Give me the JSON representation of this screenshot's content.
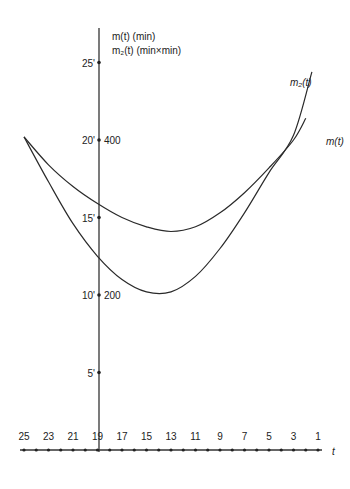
{
  "chart_data": {
    "type": "line",
    "title": "",
    "ylabel_lines": [
      "m(t) (min)",
      "m₂(t) (min×min)"
    ],
    "xlabel": "t",
    "x_ticks": [
      25,
      23,
      21,
      19,
      17,
      15,
      13,
      11,
      9,
      7,
      5,
      3,
      1
    ],
    "x_reversed": true,
    "y_ticks_left": [
      "5'",
      "10'",
      "15'",
      "20'",
      "25'"
    ],
    "y_ticks_left_values": [
      5,
      10,
      15,
      20,
      25
    ],
    "y_ticks_right": [
      "200",
      "400"
    ],
    "y_ticks_right_at": [
      10,
      20
    ],
    "ylim": [
      0,
      27
    ],
    "xlim": [
      25.5,
      0.5
    ],
    "series": [
      {
        "name": "m(t)",
        "unit": "min",
        "x": [
          25,
          23,
          21,
          19,
          17,
          15,
          13,
          11,
          9,
          7,
          5,
          3,
          2
        ],
        "values": [
          20.2,
          18.4,
          17.0,
          15.9,
          15.0,
          14.4,
          14.1,
          14.4,
          15.3,
          16.6,
          18.2,
          20.0,
          21.4
        ]
      },
      {
        "name": "m₂(t)",
        "unit": "min×min",
        "x": [
          25,
          23,
          21,
          19,
          17,
          15,
          13,
          11,
          9,
          7,
          5,
          3,
          1.5
        ],
        "values": [
          20.2,
          17.3,
          14.6,
          12.5,
          11.0,
          10.2,
          10.2,
          11.2,
          13.0,
          15.3,
          17.9,
          20.3,
          24.4
        ]
      }
    ],
    "legend": "inline labels at right ends",
    "grid": false
  },
  "labels": {
    "y_title_1": "m(t) (min)",
    "y_title_2": "m₂(t) (min×min)",
    "series_m": "m(t)",
    "series_m2": "m₂(t)",
    "x_axis": "t"
  }
}
